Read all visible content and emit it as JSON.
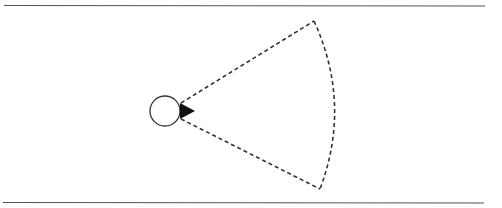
{
  "diagram": {
    "type": "field-of-view sector",
    "colors": {
      "background": "#ffffff",
      "stroke": "#333333",
      "boundary": "#555555",
      "indicator": "#111111"
    },
    "boundaries": {
      "top": {
        "x1": 4,
        "y1": 5,
        "x2": 485,
        "y2": 6
      },
      "bottom": {
        "x1": 3,
        "y1": 202,
        "x2": 484,
        "y2": 203
      }
    },
    "agent": {
      "center": [
        165,
        111
      ],
      "radius": 15,
      "heading_indicator": "filled-triangle-right"
    },
    "sector": {
      "apex_top": [
        181,
        103
      ],
      "apex_bottom": [
        181,
        119
      ],
      "far_top": [
        314,
        21
      ],
      "far_bottom": [
        320,
        189
      ],
      "arc_bulge": [
        337,
        110
      ],
      "line_style": "dashed"
    }
  }
}
